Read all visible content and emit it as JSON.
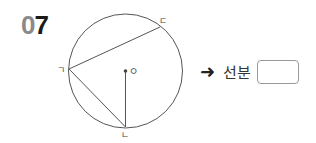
{
  "problem": {
    "number_first_digit": "0",
    "number_second_digit": "7"
  },
  "figure": {
    "center_label": "ㅇ",
    "points": {
      "giyeok": "ㄱ",
      "nieun": "ㄴ",
      "digeut": "ㄷ"
    }
  },
  "answer": {
    "arrow": "➜",
    "prefix_label": "선분",
    "value": ""
  },
  "colors": {
    "line": "#555555",
    "digit_gray": "#8a8a8a",
    "digit_black": "#1a1a1a",
    "box_border": "#999999"
  }
}
